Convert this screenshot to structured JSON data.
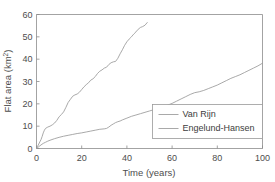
{
  "figure": {
    "background_color": "#ffffff",
    "axis_color": "#8c8c8c",
    "line_color": "#9a9a9a",
    "text_color": "#4d4d4d"
  },
  "chart_data": {
    "type": "line",
    "title": "",
    "xlabel": "Time (years)",
    "ylabel_main": "Flat area (km",
    "ylabel_sup": "2",
    "ylabel_close": ")",
    "ylabel_full": "Flat area (km 2 )",
    "xlim": [
      0,
      100
    ],
    "ylim": [
      0,
      60
    ],
    "xticks": [
      0,
      20,
      40,
      60,
      80,
      100
    ],
    "yticks": [
      0,
      10,
      20,
      30,
      40,
      50,
      60
    ],
    "xtick_labels": [
      "0",
      "20",
      "40",
      "60",
      "80",
      "100"
    ],
    "ytick_labels": [
      "0",
      "10",
      "20",
      "30",
      "40",
      "50",
      "60"
    ],
    "grid": false,
    "legend_position": "center-right",
    "series": [
      {
        "name": "Van Rijn",
        "color": "#9a9a9a",
        "x": [
          0,
          0.5,
          1,
          1.5,
          2,
          2.5,
          3,
          3.5,
          4,
          5,
          6,
          7,
          8,
          9,
          10,
          11,
          12,
          13,
          14,
          15,
          16,
          17,
          18,
          19,
          20,
          21,
          22,
          23,
          24,
          25,
          26,
          27,
          28,
          29,
          30,
          31,
          32,
          33,
          34,
          35,
          36,
          37,
          38,
          39,
          40,
          41,
          42,
          43,
          44,
          45,
          46,
          47,
          48,
          49
        ],
        "y": [
          0,
          1.0,
          2.0,
          3.0,
          4.0,
          5.4,
          7.0,
          8.2,
          9.0,
          9.6,
          10.0,
          10.6,
          11.4,
          12.6,
          14.2,
          15.2,
          16.4,
          18.4,
          20.6,
          22.0,
          23.4,
          24.0,
          24.4,
          25.2,
          26.4,
          27.6,
          28.6,
          29.4,
          30.6,
          31.2,
          32.2,
          33.6,
          34.6,
          35.2,
          36.0,
          36.4,
          37.6,
          38.4,
          38.8,
          39.0,
          40.4,
          42.4,
          44.2,
          46.2,
          47.8,
          49.0,
          50.0,
          51.2,
          52.2,
          53.4,
          54.2,
          54.6,
          55.2,
          56.4
        ]
      },
      {
        "name": "Engelund-Hansen",
        "color": "#9a9a9a",
        "x": [
          0,
          0.5,
          1,
          1.5,
          2,
          3,
          4,
          5,
          6,
          8,
          10,
          12,
          14,
          16,
          18,
          20,
          22,
          24,
          26,
          28,
          30,
          31,
          32,
          33,
          34,
          35,
          36,
          37,
          38,
          40,
          42,
          44,
          46,
          48,
          50,
          52,
          54,
          56,
          58,
          60,
          62,
          64,
          66,
          68,
          70,
          72,
          74,
          76,
          78,
          80,
          82,
          84,
          86,
          88,
          90,
          92,
          94,
          96,
          98,
          100
        ],
        "y": [
          0,
          0.4,
          0.8,
          1.2,
          1.6,
          2.3,
          2.8,
          3.3,
          3.7,
          4.4,
          5.0,
          5.5,
          5.9,
          6.3,
          6.7,
          7.0,
          7.4,
          7.8,
          8.2,
          8.6,
          8.8,
          9.0,
          9.6,
          10.4,
          11.0,
          11.6,
          12.0,
          12.3,
          12.8,
          13.6,
          14.4,
          15.0,
          15.6,
          16.2,
          16.8,
          17.4,
          18.0,
          18.6,
          19.4,
          20.2,
          21.2,
          22.2,
          23.2,
          24.2,
          25.0,
          25.4,
          26.0,
          26.8,
          27.6,
          28.4,
          29.4,
          30.4,
          31.4,
          32.2,
          33.0,
          34.0,
          35.0,
          36.0,
          37.0,
          38.2
        ]
      }
    ]
  }
}
